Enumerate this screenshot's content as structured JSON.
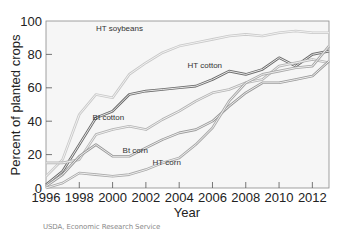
{
  "chart_data": {
    "type": "line",
    "title": "",
    "xlabel": "Year",
    "ylabel": "Percent of planted crops",
    "xlim": [
      1996,
      2013
    ],
    "ylim": [
      0,
      100
    ],
    "x_ticks": [
      1996,
      1998,
      2000,
      2002,
      2004,
      2006,
      2008,
      2010,
      2012
    ],
    "y_ticks": [
      0,
      20,
      40,
      60,
      80,
      100
    ],
    "grid": false,
    "legend": "inline labels",
    "x": [
      1996,
      1997,
      1998,
      1999,
      2000,
      2001,
      2002,
      2003,
      2004,
      2005,
      2006,
      2007,
      2008,
      2009,
      2010,
      2011,
      2012,
      2013
    ],
    "series": [
      {
        "name": "HT soybeans",
        "label_pos": [
          1999,
          94
        ],
        "color": "#c8c8c8",
        "values": [
          7,
          17,
          44,
          56,
          54,
          68,
          75,
          81,
          85,
          87,
          89,
          91,
          92,
          91,
          93,
          94,
          93,
          93
        ]
      },
      {
        "name": "HT cotton",
        "label_pos": [
          2004.5,
          72
        ],
        "color": "#6a6a6a",
        "values": [
          2,
          10,
          26,
          42,
          46,
          56,
          58,
          59,
          60,
          61,
          65,
          70,
          68,
          71,
          78,
          73,
          80,
          82
        ]
      },
      {
        "name": "Bt cotton",
        "label_pos": [
          1998.8,
          41
        ],
        "color": "#b4b4b4",
        "values": [
          15,
          15,
          17,
          32,
          35,
          37,
          35,
          41,
          46,
          52,
          57,
          59,
          63,
          65,
          73,
          75,
          77,
          75
        ]
      },
      {
        "name": "Bt corn",
        "label_pos": [
          2000.6,
          21
        ],
        "color": "#9a9a9a",
        "values": [
          1,
          8,
          19,
          26,
          19,
          19,
          24,
          29,
          33,
          35,
          40,
          49,
          57,
          63,
          63,
          65,
          67,
          76
        ]
      },
      {
        "name": "HT corn",
        "label_pos": [
          2002.4,
          14
        ],
        "color": "#a8a8a8",
        "values": [
          0,
          3,
          9,
          8,
          7,
          8,
          11,
          15,
          18,
          26,
          36,
          52,
          63,
          68,
          70,
          72,
          73,
          85
        ]
      }
    ]
  },
  "labels": {
    "ylabel": "Percent of planted crops",
    "xlabel": "Year",
    "source": "USDA, Economic Research Service"
  }
}
